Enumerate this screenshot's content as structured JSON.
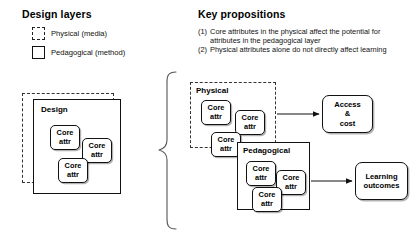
{
  "legend": {
    "title": "Design layers",
    "items": [
      {
        "swatch": "dashed-square-icon",
        "label": "Physical (media)"
      },
      {
        "swatch": "solid-square-icon",
        "label": "Pedagogical (method)"
      }
    ]
  },
  "propositions": {
    "title": "Key propositions",
    "items": [
      {
        "num": "(1)",
        "text": "Core attributes in the physical affect the potential for attributes in the pedagogical layer"
      },
      {
        "num": "(2)",
        "text": "Physical attributes alone do not directly affect learning"
      }
    ]
  },
  "left_diagram": {
    "outer_label": "physical-layer-dashed-boundary",
    "design_box": {
      "title": "Design",
      "chips": [
        {
          "line1": "Core",
          "line2": "attr"
        },
        {
          "line1": "Core",
          "line2": "attr"
        },
        {
          "line1": "Core",
          "line2": "attr"
        }
      ]
    }
  },
  "brace": {
    "glyph": "left-curly-brace"
  },
  "right_diagram": {
    "physical": {
      "title": "Physical",
      "chips": [
        {
          "line1": "Core",
          "line2": "attr"
        },
        {
          "line1": "Core",
          "line2": "attr"
        },
        {
          "line1": "Core",
          "line2": "attr"
        }
      ]
    },
    "pedagogical": {
      "title": "Pedagogical",
      "chips": [
        {
          "line1": "Core",
          "line2": "attr"
        },
        {
          "line1": "Core",
          "line2": "attr"
        },
        {
          "line1": "Core",
          "line2": "attr"
        }
      ]
    },
    "outcomes": [
      {
        "line1": "Access",
        "line2": "&",
        "line3": "cost"
      },
      {
        "line1": "Learning",
        "line2": "outcomes"
      }
    ]
  },
  "colors": {
    "ink": "#111111",
    "dash": "#333333",
    "paper": "#ffffff"
  }
}
